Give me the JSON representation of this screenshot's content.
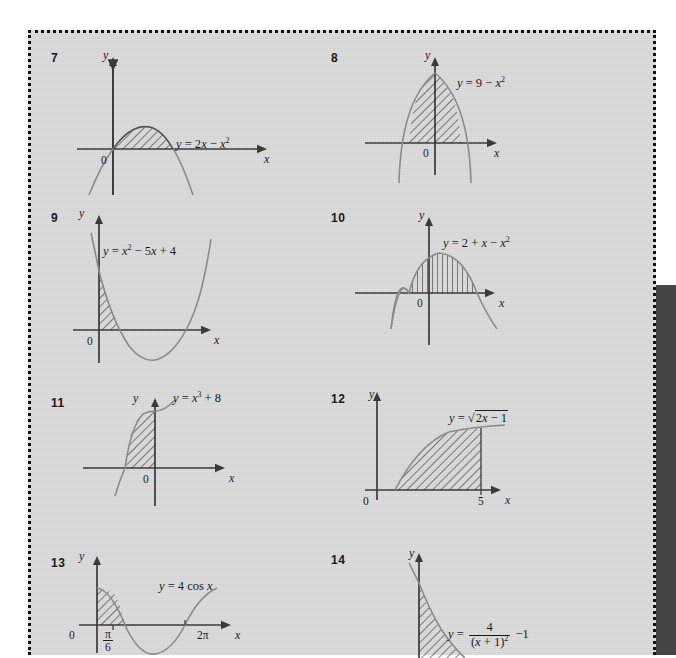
{
  "page": {
    "background_color": "#dcdcdc",
    "border_style": "dotted",
    "border_color": "#111111",
    "right_panel_color": "#454545"
  },
  "problems": [
    {
      "number": "7",
      "equation_plain": "y = 2x - x²",
      "equation_parts": {
        "lhs": "y",
        "eq": "=",
        "term1": "2x",
        "minus": "−",
        "term2": "x",
        "exp2": "2"
      },
      "axis_x": "x",
      "axis_y": "y",
      "origin_label": "0",
      "tick_labels": [],
      "curve": "downward parabola through origin, shaded region from x=0 to x=2 above axis",
      "shaded": true
    },
    {
      "number": "8",
      "equation_plain": "y = 9 - x²",
      "equation_parts": {
        "lhs": "y",
        "eq": "=",
        "term1": "9",
        "minus": "−",
        "term2": "x",
        "exp2": "2"
      },
      "axis_x": "x",
      "axis_y": "y",
      "origin_label": "0",
      "tick_labels": [],
      "curve": "downward parabola peaking on y-axis, shaded region between the two x-intercepts",
      "shaded": true
    },
    {
      "number": "9",
      "equation_plain": "y = x² - 5x + 4",
      "equation_parts": {
        "lhs": "y",
        "eq": "=",
        "term1": "x",
        "exp1": "2",
        "minus": "−",
        "term2": "5x",
        "plus": "+",
        "term3": "4"
      },
      "axis_x": "x",
      "axis_y": "y",
      "origin_label": "0",
      "tick_labels": [],
      "curve": "upward parabola crossing axis at x=1 and x=4, shaded region from x=0 to x=1 above axis",
      "shaded": true
    },
    {
      "number": "10",
      "equation_plain": "y = 2 + x - x²",
      "equation_parts": {
        "lhs": "y",
        "eq": "=",
        "term1": "2",
        "plus": "+",
        "term2": "x",
        "minus": "−",
        "term3": "x",
        "exp3": "2"
      },
      "axis_x": "x",
      "axis_y": "y",
      "origin_label": "0",
      "tick_labels": [],
      "curve": "downward parabola, shaded region between x=-1 and x=2 above axis",
      "shaded": true
    },
    {
      "number": "11",
      "equation_plain": "y = x³ + 8",
      "equation_parts": {
        "lhs": "y",
        "eq": "=",
        "term1": "x",
        "exp1": "3",
        "plus": "+",
        "term2": "8"
      },
      "axis_x": "x",
      "axis_y": "y",
      "origin_label": "0",
      "tick_labels": [],
      "curve": "cubic rising through x=-2, shaded region from x=-2 to x=0 above axis",
      "shaded": true
    },
    {
      "number": "12",
      "equation_plain": "y = √(2x - 1)",
      "equation_parts": {
        "lhs": "y",
        "eq": "=",
        "radical": "√",
        "inner1": "2x",
        "minus": "−",
        "inner2": "1"
      },
      "axis_x": "x",
      "axis_y": "y",
      "origin_label": "0",
      "tick_labels": [
        "5"
      ],
      "curve": "square root curve from x=0.5 rising, shaded region up to x=5",
      "shaded": true
    },
    {
      "number": "13",
      "equation_plain": "y = 4 cos x",
      "equation_parts": {
        "lhs": "y",
        "eq": "=",
        "coef": "4",
        "func": "cos",
        "arg": "x"
      },
      "axis_x": "x",
      "axis_y": "y",
      "origin_label": "0",
      "tick_labels": [
        "π/6",
        "2π"
      ],
      "tick_pi_numerator": "π",
      "tick_pi_denominator": "6",
      "tick_two_pi": "2π",
      "curve": "cosine wave of amplitude 4 over 0 to 2pi, shaded region from 0 to pi/6",
      "shaded": true
    },
    {
      "number": "14",
      "equation_plain": "y = 4/(x + 1)² - 1",
      "equation_parts": {
        "lhs": "y",
        "eq": "=",
        "num": "4",
        "den_open": "(",
        "den_x": "x",
        "den_plus": "+",
        "den_one": "1",
        "den_close": ")",
        "den_exp": "2",
        "minus": "−",
        "trailing": "1"
      },
      "axis_x": "x",
      "axis_y": "y",
      "origin_label": "0",
      "tick_labels": [],
      "curve": "decaying rational curve falling steeply from the y-axis, shaded region beneath it",
      "shaded": true
    }
  ]
}
